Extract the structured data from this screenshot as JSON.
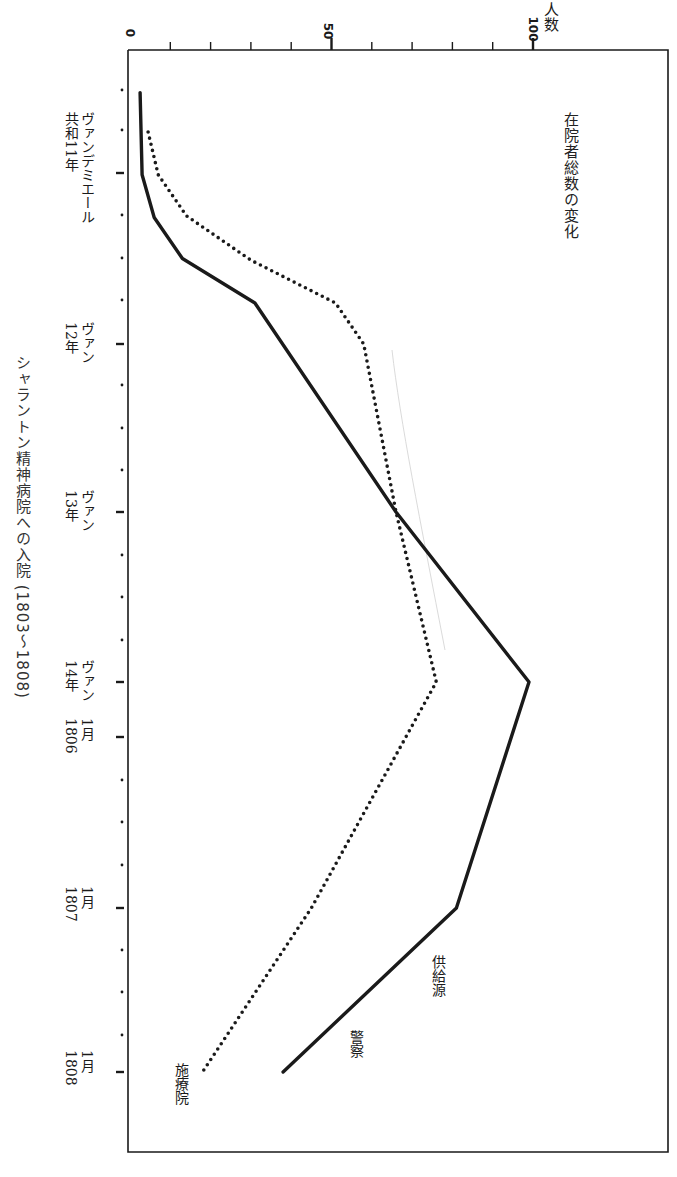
{
  "caption": "シャラントン精神病院への入院 (1803〜1808)",
  "chart_data": {
    "type": "line",
    "title": "在院者総数の変化",
    "orientation": "rotated 90° clockwise (time axis runs top→bottom, value axis left→right)",
    "ylabel": "人数",
    "xlabel": "",
    "ylim": [
      0,
      100
    ],
    "yticks": [
      0,
      50,
      100
    ],
    "y_minor_step": 10,
    "x_ticks": [
      {
        "label": "ヴァンデミエール 共和11年",
        "line1": "ヴァンデミエール",
        "line2": "共和11年",
        "pos": 0
      },
      {
        "label": "ヴァン 12年",
        "line1": "ヴァン",
        "line2": "12年",
        "pos": 1
      },
      {
        "label": "ヴァン 13年",
        "line1": "ヴァン",
        "line2": "13年",
        "pos": 2
      },
      {
        "label": "ヴァン 14年",
        "line1": "ヴァン",
        "line2": "14年",
        "pos": 3
      },
      {
        "label": "1月 1806",
        "line1": "1月",
        "line2": "1806",
        "pos": 3.32
      },
      {
        "label": "1月 1807",
        "line1": "1月",
        "line2": "1807",
        "pos": 4.32
      },
      {
        "label": "1月 1808",
        "line1": "1月",
        "line2": "1808",
        "pos": 5.28
      }
    ],
    "grid": false,
    "series": [
      {
        "name": "供給源 警察",
        "style": "solid",
        "points": [
          {
            "x": -0.47,
            "y": 2.5
          },
          {
            "x": 0.01,
            "y": 3
          },
          {
            "x": 0.26,
            "y": 6
          },
          {
            "x": 0.5,
            "y": 13
          },
          {
            "x": 0.76,
            "y": 31
          },
          {
            "x": 2.0,
            "y": 66
          },
          {
            "x": 3.0,
            "y": 99
          },
          {
            "x": 4.32,
            "y": 81
          },
          {
            "x": 5.28,
            "y": 38
          }
        ]
      },
      {
        "name": "施療院",
        "style": "dotted",
        "points": [
          {
            "x": -0.24,
            "y": 4.5
          },
          {
            "x": 0.01,
            "y": 7
          },
          {
            "x": 0.25,
            "y": 14
          },
          {
            "x": 0.51,
            "y": 30
          },
          {
            "x": 0.76,
            "y": 51
          },
          {
            "x": 1.0,
            "y": 58
          },
          {
            "x": 2.0,
            "y": 66
          },
          {
            "x": 3.0,
            "y": 76
          },
          {
            "x": 4.32,
            "y": 45
          },
          {
            "x": 5.28,
            "y": 18
          }
        ]
      }
    ],
    "labels": {
      "source_header": "供給源",
      "police": "警察",
      "hospital": "施療院"
    }
  },
  "colors": {
    "ink": "#1a1a1a",
    "background": "#ffffff",
    "faint": "#c8c8c8"
  }
}
